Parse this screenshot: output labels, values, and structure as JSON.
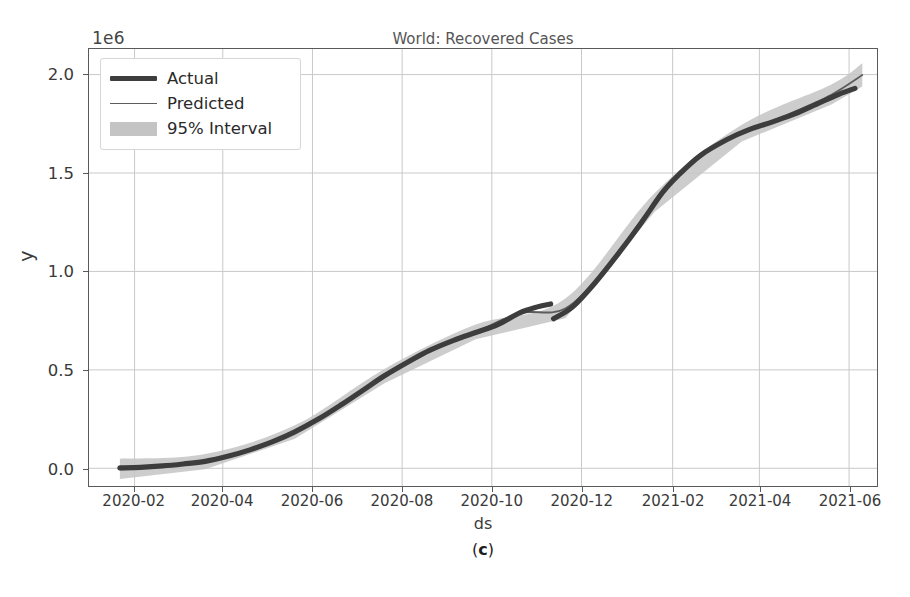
{
  "figure": {
    "caption_prefix": "(",
    "caption_letter": "c",
    "caption_suffix": ")",
    "caption": "(c)"
  },
  "chart_data": {
    "type": "line",
    "title": "World: Recovered Cases",
    "xlabel": "ds",
    "ylabel": "y",
    "y_offset_label": "1e6",
    "y_offset_value": 1000000,
    "grid": true,
    "legend_position": "upper left",
    "xlim": [
      "2020-01-01",
      "2021-06-20"
    ],
    "ylim": [
      -90000,
      2130000
    ],
    "yticks": [
      0,
      500000,
      1000000,
      1500000,
      2000000
    ],
    "ytick_labels": [
      "0.0",
      "0.5",
      "1.0",
      "1.5",
      "2.0"
    ],
    "xticks": [
      "2020-02",
      "2020-04",
      "2020-06",
      "2020-08",
      "2020-10",
      "2020-12",
      "2021-02",
      "2021-04",
      "2021-06"
    ],
    "xtick_labels": [
      "2020-02",
      "2020-04",
      "2020-06",
      "2020-08",
      "2020-10",
      "2020-12",
      "2021-02",
      "2021-04",
      "2021-06"
    ],
    "colors": {
      "actual": "#3d3d3d",
      "predicted": "#5c5c5c",
      "interval": "#c4c4c4",
      "grid": "#c9c9c9",
      "frame": "#5a5a5a",
      "background": "#ffffff"
    },
    "series": [
      {
        "name": "Actual",
        "style": "thick-line-with-markers",
        "x": [
          "2020-01-22",
          "2020-02-05",
          "2020-02-20",
          "2020-03-05",
          "2020-03-20",
          "2020-04-05",
          "2020-04-20",
          "2020-05-05",
          "2020-05-20",
          "2020-06-05",
          "2020-06-20",
          "2020-07-05",
          "2020-07-20",
          "2020-08-05",
          "2020-08-20",
          "2020-09-05",
          "2020-09-20",
          "2020-10-05",
          "2020-10-20",
          "2020-11-01",
          "2020-11-10",
          "2020-11-12",
          "2020-11-25",
          "2020-12-10",
          "2020-12-25",
          "2021-01-10",
          "2021-01-25",
          "2021-02-05",
          "2021-02-20",
          "2021-03-10",
          "2021-03-25",
          "2021-04-10",
          "2021-04-25",
          "2021-05-10",
          "2021-05-25",
          "2021-06-05"
        ],
        "values": [
          2000,
          5000,
          12000,
          22000,
          35000,
          62000,
          95000,
          135000,
          185000,
          250000,
          320000,
          395000,
          470000,
          540000,
          600000,
          650000,
          690000,
          730000,
          790000,
          820000,
          835000,
          760000,
          820000,
          940000,
          1080000,
          1240000,
          1400000,
          1490000,
          1590000,
          1670000,
          1720000,
          1760000,
          1800000,
          1850000,
          1900000,
          1930000
        ]
      },
      {
        "name": "Predicted",
        "style": "thin-line",
        "x": [
          "2020-01-22",
          "2020-02-20",
          "2020-03-20",
          "2020-04-20",
          "2020-05-20",
          "2020-06-20",
          "2020-07-20",
          "2020-08-20",
          "2020-09-20",
          "2020-10-20",
          "2020-11-20",
          "2020-12-20",
          "2021-01-20",
          "2021-02-20",
          "2021-03-20",
          "2021-04-20",
          "2021-05-20",
          "2021-06-10"
        ],
        "values": [
          -5000,
          10000,
          33000,
          93000,
          183000,
          318000,
          468000,
          602000,
          692000,
          788000,
          812000,
          1040000,
          1352000,
          1592000,
          1702000,
          1796000,
          1898000,
          1998000
        ]
      },
      {
        "name": "95% Interval",
        "style": "band",
        "x": [
          "2020-01-22",
          "2020-03-20",
          "2020-05-20",
          "2020-07-20",
          "2020-09-20",
          "2020-11-20",
          "2021-01-20",
          "2021-03-20",
          "2021-05-20",
          "2021-06-10"
        ],
        "lower": [
          -55000,
          -5000,
          150000,
          432000,
          655000,
          762000,
          1305000,
          1660000,
          1848000,
          1940000
        ],
        "upper": [
          48000,
          72000,
          218000,
          505000,
          730000,
          862000,
          1400000,
          1745000,
          1950000,
          2058000
        ]
      }
    ],
    "annotations": [
      {
        "text": "discontinuity / downward revision",
        "x": "2020-11-12",
        "y": 760000
      }
    ]
  },
  "legend": {
    "entries": [
      {
        "label": "Actual",
        "swatch": "thick-line",
        "color": "#3d3d3d"
      },
      {
        "label": "Predicted",
        "swatch": "thin-line",
        "color": "#5c5c5c"
      },
      {
        "label": "95% Interval",
        "swatch": "band",
        "color": "#c4c4c4"
      }
    ]
  }
}
